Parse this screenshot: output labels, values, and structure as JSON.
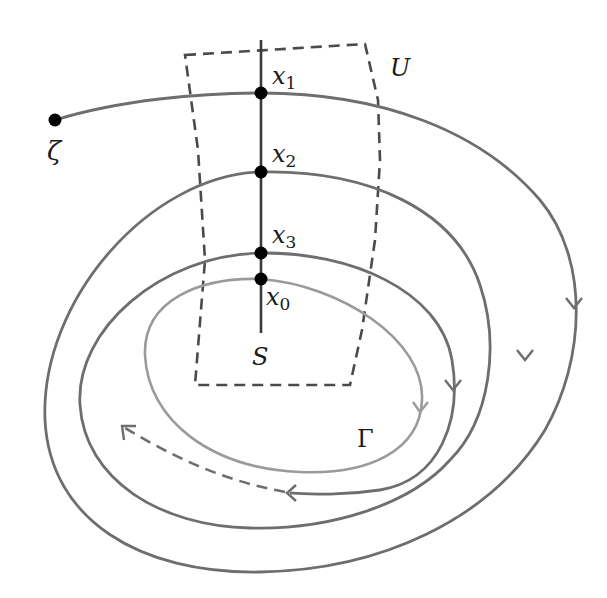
{
  "diagram": {
    "labels": {
      "zeta": "ζ",
      "U": "U",
      "S": "S",
      "Gamma": "Γ",
      "x1": "x",
      "x1_sub": "1",
      "x2": "x",
      "x2_sub": "2",
      "x3": "x",
      "x3_sub": "3",
      "x0": "x",
      "x0_sub": "0"
    },
    "points": [
      {
        "name": "zeta",
        "x": 55,
        "y": 120
      },
      {
        "name": "x1",
        "x": 261,
        "y": 93
      },
      {
        "name": "x2",
        "x": 261,
        "y": 172
      },
      {
        "name": "x3",
        "x": 261,
        "y": 253
      },
      {
        "name": "x0",
        "x": 261,
        "y": 279
      }
    ],
    "colors": {
      "trajectory": "#6e6e6e",
      "limit_cycle": "#9a9a9a",
      "section": "#3a3a3a",
      "neighborhood": "#4a4a4a",
      "point": "#000000",
      "text": "#1a1a1a"
    }
  }
}
